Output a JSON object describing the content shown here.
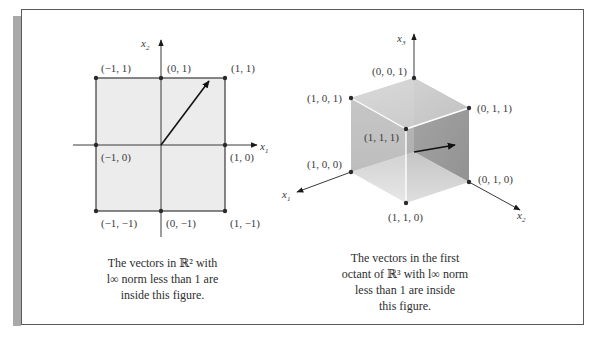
{
  "figure_2d": {
    "axis_labels": {
      "x": "x",
      "x_sub": "1",
      "y": "x",
      "y_sub": "2"
    },
    "points": [
      {
        "label": "(−1, 1)"
      },
      {
        "label": "(0, 1)"
      },
      {
        "label": "(1, 1)"
      },
      {
        "label": "(−1, 0)"
      },
      {
        "label": "(1, 0)"
      },
      {
        "label": "(−1, −1)"
      },
      {
        "label": "(0, −1)"
      },
      {
        "label": "(1, −1)"
      }
    ],
    "caption": [
      "The vectors in ℝ² with",
      "l∞ norm less than 1 are",
      "inside this figure."
    ],
    "fill_color": "#ececec"
  },
  "figure_3d": {
    "axis_labels": {
      "x1": "x",
      "x1_sub": "1",
      "x2": "x",
      "x2_sub": "2",
      "x3": "x",
      "x3_sub": "3"
    },
    "points": [
      {
        "label": "(0, 0, 1)"
      },
      {
        "label": "(1, 0, 1)"
      },
      {
        "label": "(0, 1, 1)"
      },
      {
        "label": "(1, 1, 1)"
      },
      {
        "label": "(1, 0, 0)"
      },
      {
        "label": "(0, 1, 0)"
      },
      {
        "label": "(1, 1, 0)"
      }
    ],
    "caption": [
      "The vectors in the first",
      "octant of ℝ³ with l∞ norm",
      "less than 1 are inside",
      "this figure."
    ]
  }
}
